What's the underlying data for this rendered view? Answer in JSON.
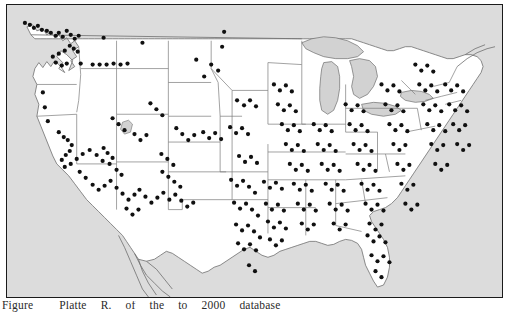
{
  "figure": {
    "caption_lead": "Figure",
    "caption_words": [
      "Platte",
      "R.",
      "of",
      "the",
      "to",
      "2000",
      "database"
    ],
    "caption_full": "Figure    Platte R.      of   the     to  2000  database",
    "frame_color": "#1b1b1b",
    "ocean_color": "#dcdcdc",
    "land_color": "#ffffff",
    "lake_color": "#d2d2d2",
    "border_color": "#7a7a7a",
    "coast_color": "#6e6e6e",
    "dot_color": "#101010"
  },
  "map": {
    "title": "Dot distribution map of the contiguous United States",
    "region": "Contiguous United States",
    "projection_hint": "conic",
    "legend": [],
    "annotations": []
  },
  "chart_data": {
    "type": "scatter",
    "xlabel": "",
    "ylabel": "",
    "marker": "filled-circle",
    "marker_color": "#101010",
    "marker_radius_px": 2.1,
    "point_count": 318,
    "density_notes": [
      "Very dense along the Northeast corridor (Boston - New York - Philadelphia - Baltimore)",
      "Dense on coastal California (San Francisco Bay Area and Los Angeles basin)",
      "Dense along the Gulf Coast of Texas and Louisiana",
      "Dense down the Florida peninsula",
      "Sparse across Montana, Wyoming, the Dakotas and the Great Basin"
    ],
    "points": [
      [
        18,
        18
      ],
      [
        23,
        20
      ],
      [
        27,
        23
      ],
      [
        31,
        21
      ],
      [
        35,
        25
      ],
      [
        40,
        26
      ],
      [
        44,
        28
      ],
      [
        49,
        31
      ],
      [
        52,
        28
      ],
      [
        56,
        32
      ],
      [
        60,
        26
      ],
      [
        64,
        30
      ],
      [
        68,
        34
      ],
      [
        72,
        31
      ],
      [
        63,
        41
      ],
      [
        67,
        44
      ],
      [
        71,
        47
      ],
      [
        58,
        46
      ],
      [
        52,
        49
      ],
      [
        46,
        52
      ],
      [
        49,
        58
      ],
      [
        55,
        61
      ],
      [
        60,
        59
      ],
      [
        74,
        59
      ],
      [
        86,
        60
      ],
      [
        93,
        60
      ],
      [
        100,
        60
      ],
      [
        107,
        59
      ],
      [
        114,
        60
      ],
      [
        121,
        59
      ],
      [
        97,
        33
      ],
      [
        136,
        38
      ],
      [
        218,
        27
      ],
      [
        216,
        42
      ],
      [
        36,
        88
      ],
      [
        38,
        103
      ],
      [
        41,
        117
      ],
      [
        52,
        128
      ],
      [
        57,
        133
      ],
      [
        61,
        136
      ],
      [
        65,
        141
      ],
      [
        63,
        147
      ],
      [
        59,
        151
      ],
      [
        55,
        156
      ],
      [
        58,
        163
      ],
      [
        64,
        160
      ],
      [
        70,
        155
      ],
      [
        76,
        150
      ],
      [
        83,
        146
      ],
      [
        90,
        151
      ],
      [
        96,
        157
      ],
      [
        73,
        168
      ],
      [
        79,
        174
      ],
      [
        86,
        181
      ],
      [
        92,
        186
      ],
      [
        98,
        182
      ],
      [
        104,
        177
      ],
      [
        110,
        184
      ],
      [
        116,
        190
      ],
      [
        122,
        196
      ],
      [
        128,
        191
      ],
      [
        133,
        186
      ],
      [
        139,
        193
      ],
      [
        145,
        199
      ],
      [
        151,
        194
      ],
      [
        157,
        189
      ],
      [
        120,
        205
      ],
      [
        126,
        211
      ],
      [
        132,
        206
      ],
      [
        97,
        144
      ],
      [
        101,
        149
      ],
      [
        106,
        154
      ],
      [
        103,
        160
      ],
      [
        110,
        166
      ],
      [
        115,
        171
      ],
      [
        163,
        196
      ],
      [
        169,
        191
      ],
      [
        175,
        197
      ],
      [
        181,
        203
      ],
      [
        187,
        199
      ],
      [
        156,
        168
      ],
      [
        162,
        173
      ],
      [
        168,
        178
      ],
      [
        174,
        183
      ],
      [
        155,
        150
      ],
      [
        161,
        155
      ],
      [
        167,
        161
      ],
      [
        170,
        124
      ],
      [
        176,
        130
      ],
      [
        182,
        136
      ],
      [
        188,
        131
      ],
      [
        197,
        128
      ],
      [
        203,
        134
      ],
      [
        209,
        129
      ],
      [
        215,
        135
      ],
      [
        231,
        96
      ],
      [
        238,
        101
      ],
      [
        244,
        96
      ],
      [
        250,
        102
      ],
      [
        224,
        123
      ],
      [
        230,
        129
      ],
      [
        236,
        124
      ],
      [
        242,
        130
      ],
      [
        233,
        152
      ],
      [
        239,
        158
      ],
      [
        245,
        153
      ],
      [
        251,
        159
      ],
      [
        225,
        176
      ],
      [
        231,
        182
      ],
      [
        237,
        177
      ],
      [
        243,
        183
      ],
      [
        249,
        189
      ],
      [
        228,
        199
      ],
      [
        234,
        205
      ],
      [
        240,
        200
      ],
      [
        246,
        206
      ],
      [
        252,
        212
      ],
      [
        230,
        221
      ],
      [
        236,
        227
      ],
      [
        242,
        222
      ],
      [
        248,
        228
      ],
      [
        254,
        234
      ],
      [
        232,
        240
      ],
      [
        238,
        246
      ],
      [
        244,
        241
      ],
      [
        250,
        247
      ],
      [
        243,
        262
      ],
      [
        249,
        268
      ],
      [
        258,
        178
      ],
      [
        264,
        184
      ],
      [
        270,
        179
      ],
      [
        276,
        185
      ],
      [
        260,
        200
      ],
      [
        266,
        206
      ],
      [
        272,
        201
      ],
      [
        278,
        207
      ],
      [
        262,
        218
      ],
      [
        268,
        224
      ],
      [
        274,
        219
      ],
      [
        280,
        225
      ],
      [
        264,
        236
      ],
      [
        270,
        242
      ],
      [
        276,
        237
      ],
      [
        268,
        80
      ],
      [
        274,
        86
      ],
      [
        280,
        81
      ],
      [
        286,
        87
      ],
      [
        272,
        100
      ],
      [
        278,
        106
      ],
      [
        284,
        101
      ],
      [
        290,
        107
      ],
      [
        276,
        120
      ],
      [
        282,
        126
      ],
      [
        288,
        121
      ],
      [
        294,
        127
      ],
      [
        280,
        140
      ],
      [
        286,
        146
      ],
      [
        292,
        141
      ],
      [
        298,
        147
      ],
      [
        284,
        160
      ],
      [
        290,
        166
      ],
      [
        296,
        161
      ],
      [
        302,
        167
      ],
      [
        288,
        180
      ],
      [
        294,
        186
      ],
      [
        300,
        181
      ],
      [
        306,
        187
      ],
      [
        292,
        200
      ],
      [
        298,
        206
      ],
      [
        304,
        201
      ],
      [
        310,
        207
      ],
      [
        296,
        220
      ],
      [
        302,
        226
      ],
      [
        308,
        221
      ],
      [
        308,
        120
      ],
      [
        314,
        126
      ],
      [
        320,
        121
      ],
      [
        326,
        127
      ],
      [
        312,
        140
      ],
      [
        318,
        146
      ],
      [
        324,
        141
      ],
      [
        330,
        147
      ],
      [
        316,
        160
      ],
      [
        322,
        166
      ],
      [
        328,
        161
      ],
      [
        334,
        167
      ],
      [
        320,
        180
      ],
      [
        326,
        186
      ],
      [
        332,
        181
      ],
      [
        338,
        187
      ],
      [
        324,
        200
      ],
      [
        330,
        206
      ],
      [
        336,
        201
      ],
      [
        342,
        207
      ],
      [
        328,
        220
      ],
      [
        334,
        226
      ],
      [
        340,
        221
      ],
      [
        340,
        100
      ],
      [
        346,
        106
      ],
      [
        352,
        101
      ],
      [
        358,
        107
      ],
      [
        344,
        120
      ],
      [
        350,
        126
      ],
      [
        356,
        121
      ],
      [
        362,
        127
      ],
      [
        348,
        140
      ],
      [
        354,
        146
      ],
      [
        360,
        141
      ],
      [
        366,
        147
      ],
      [
        352,
        160
      ],
      [
        358,
        166
      ],
      [
        364,
        161
      ],
      [
        370,
        167
      ],
      [
        356,
        180
      ],
      [
        362,
        186
      ],
      [
        368,
        181
      ],
      [
        374,
        187
      ],
      [
        360,
        200
      ],
      [
        366,
        206
      ],
      [
        372,
        201
      ],
      [
        378,
        207
      ],
      [
        364,
        220
      ],
      [
        370,
        226
      ],
      [
        376,
        221
      ],
      [
        376,
        80
      ],
      [
        382,
        86
      ],
      [
        388,
        81
      ],
      [
        394,
        87
      ],
      [
        380,
        100
      ],
      [
        386,
        106
      ],
      [
        392,
        101
      ],
      [
        398,
        107
      ],
      [
        384,
        120
      ],
      [
        390,
        126
      ],
      [
        396,
        121
      ],
      [
        402,
        127
      ],
      [
        388,
        140
      ],
      [
        394,
        146
      ],
      [
        400,
        141
      ],
      [
        392,
        160
      ],
      [
        398,
        166
      ],
      [
        404,
        161
      ],
      [
        396,
        180
      ],
      [
        402,
        186
      ],
      [
        408,
        181
      ],
      [
        400,
        200
      ],
      [
        406,
        206
      ],
      [
        412,
        201
      ],
      [
        410,
        60
      ],
      [
        416,
        66
      ],
      [
        422,
        61
      ],
      [
        428,
        67
      ],
      [
        414,
        80
      ],
      [
        420,
        86
      ],
      [
        426,
        81
      ],
      [
        432,
        87
      ],
      [
        418,
        100
      ],
      [
        424,
        106
      ],
      [
        430,
        101
      ],
      [
        436,
        107
      ],
      [
        422,
        120
      ],
      [
        428,
        126
      ],
      [
        434,
        121
      ],
      [
        440,
        127
      ],
      [
        426,
        140
      ],
      [
        432,
        146
      ],
      [
        438,
        141
      ],
      [
        430,
        160
      ],
      [
        436,
        166
      ],
      [
        442,
        161
      ],
      [
        440,
        80
      ],
      [
        446,
        86
      ],
      [
        452,
        81
      ],
      [
        458,
        87
      ],
      [
        444,
        100
      ],
      [
        450,
        106
      ],
      [
        456,
        101
      ],
      [
        462,
        107
      ],
      [
        448,
        120
      ],
      [
        454,
        126
      ],
      [
        460,
        121
      ],
      [
        452,
        140
      ],
      [
        458,
        146
      ],
      [
        464,
        141
      ],
      [
        362,
        232
      ],
      [
        368,
        238
      ],
      [
        374,
        233
      ],
      [
        380,
        239
      ],
      [
        366,
        252
      ],
      [
        372,
        258
      ],
      [
        378,
        253
      ],
      [
        384,
        259
      ],
      [
        370,
        268
      ],
      [
        376,
        274
      ],
      [
        205,
        60
      ],
      [
        212,
        66
      ],
      [
        198,
        72
      ],
      [
        190,
        55
      ],
      [
        150,
        105
      ],
      [
        156,
        111
      ],
      [
        144,
        99
      ],
      [
        128,
        130
      ],
      [
        134,
        136
      ],
      [
        140,
        131
      ],
      [
        112,
        120
      ],
      [
        118,
        126
      ],
      [
        106,
        114
      ]
    ]
  }
}
